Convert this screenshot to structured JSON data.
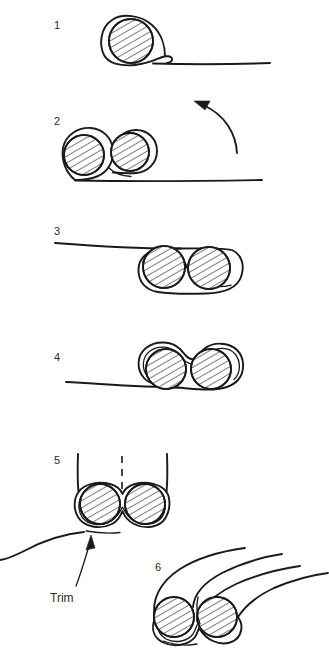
{
  "figure": {
    "background_color": "#ffffff",
    "ink_color": "#1a1a1a",
    "width": 329,
    "height": 662
  },
  "panels": [
    {
      "id": "panel-1",
      "number": "1",
      "number_x": 54,
      "number_y": 20,
      "description": "single hatched circle with sheath wrapped once, flat tail running right"
    },
    {
      "id": "panel-2",
      "number": "2",
      "number_x": 54,
      "number_y": 116,
      "description": "two hatched circles side by side above baseline, curved arrow at right"
    },
    {
      "id": "panel-3",
      "number": "3",
      "number_x": 54,
      "number_y": 226,
      "description": "two hatched circles enclosed in rounded sheath, tail runs left"
    },
    {
      "id": "panel-4",
      "number": "4",
      "number_x": 54,
      "number_y": 352,
      "description": "two hatched circles in figure-eight sheath, baseline at left"
    },
    {
      "id": "panel-5",
      "number": "5",
      "number_x": 54,
      "number_y": 455,
      "description": "two hatched circles in figure-eight with vertical legs and center dashed cut line"
    },
    {
      "id": "panel-6",
      "number": "6",
      "number_x": 155,
      "number_y": 562,
      "description": "finished two-core assembly with sheath tails sweeping up to the right"
    }
  ],
  "annotations": [
    {
      "id": "trim-callout",
      "label": "Trim",
      "label_x": 50,
      "label_y": 592,
      "arrow_from_x": 76,
      "arrow_from_y": 586,
      "arrow_to_x": 91,
      "arrow_to_y": 537,
      "points_to": "panel-5 bottom seam"
    },
    {
      "id": "rotation-arrow",
      "label": "",
      "description": "curved arrow in panel 2 indicating wrap direction, pointing up-left",
      "arrow_tail_x": 237,
      "arrow_tail_y": 152,
      "arrow_tip_x": 196,
      "arrow_tip_y": 103
    }
  ],
  "hatching": {
    "pattern": "diagonal-lines",
    "angle_deg": 60,
    "spacing_px": 6
  }
}
